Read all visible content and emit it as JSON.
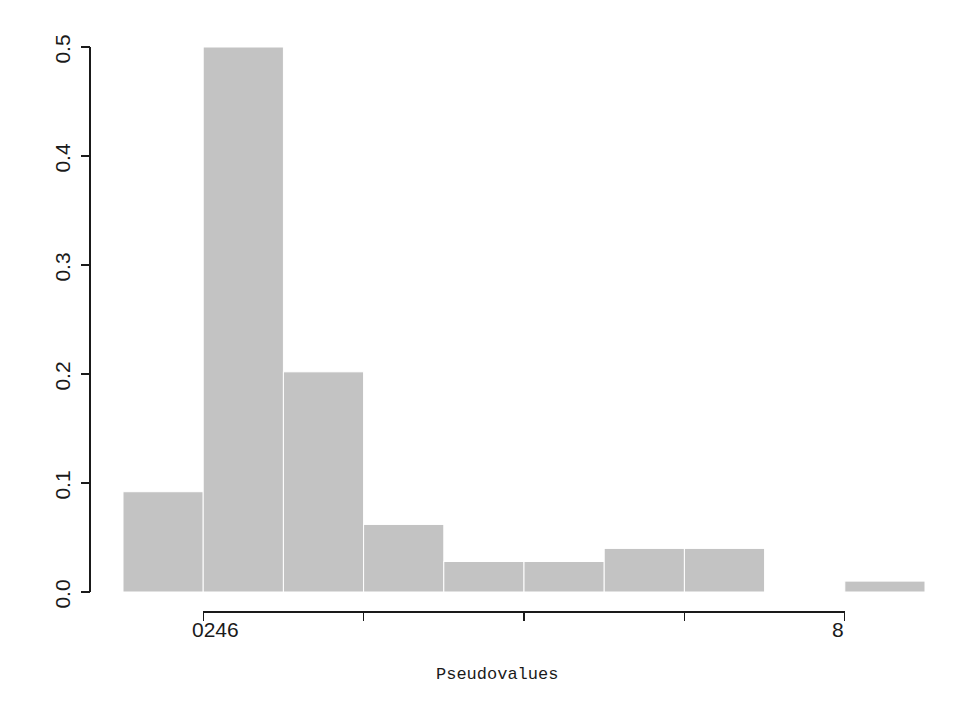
{
  "chart_data": {
    "type": "bar",
    "subtype": "histogram",
    "title": "",
    "subtitle": "",
    "xlabel": "Pseudovalues",
    "ylabel": "",
    "grid": false,
    "legend": null,
    "bar_color": "#c3c3c3",
    "axis_color": "#1a1a1a",
    "background": "#ffffff",
    "xlim": [
      -1.0,
      9.0
    ],
    "ylim": [
      0.0,
      0.5
    ],
    "y_ticks": [
      0.0,
      0.1,
      0.2,
      0.3,
      0.4,
      0.5
    ],
    "y_tick_labels": [
      "0.0",
      "0.1",
      "0.2",
      "0.3",
      "0.4",
      "0.5"
    ],
    "x_ticks": [
      0,
      2,
      4,
      6,
      8
    ],
    "x_tick_labels": [
      "0",
      "2",
      "4",
      "6",
      "8"
    ],
    "x_tick_overlap_label": "0246",
    "x_tick_last_label": "8",
    "bin_edges": [
      -1.0,
      0.0,
      1.0,
      2.0,
      3.0,
      4.0,
      5.0,
      6.0,
      7.0,
      8.0,
      9.0
    ],
    "bin_centers": [
      -0.5,
      0.5,
      1.5,
      2.5,
      3.5,
      4.5,
      5.5,
      6.5,
      7.5,
      8.5
    ],
    "values": [
      0.092,
      0.5,
      0.202,
      0.062,
      0.028,
      0.028,
      0.04,
      0.04,
      0.0,
      0.01
    ],
    "bars": [
      {
        "label": "bin--1-0",
        "x0": -1.0,
        "x1": 0.0,
        "density": 0.092
      },
      {
        "label": "bin-0-1",
        "x0": 0.0,
        "x1": 1.0,
        "density": 0.5
      },
      {
        "label": "bin-1-2",
        "x0": 1.0,
        "x1": 2.0,
        "density": 0.202
      },
      {
        "label": "bin-2-3",
        "x0": 2.0,
        "x1": 3.0,
        "density": 0.062
      },
      {
        "label": "bin-3-4",
        "x0": 3.0,
        "x1": 4.0,
        "density": 0.028
      },
      {
        "label": "bin-4-5",
        "x0": 4.0,
        "x1": 5.0,
        "density": 0.028
      },
      {
        "label": "bin-5-6",
        "x0": 5.0,
        "x1": 6.0,
        "density": 0.04
      },
      {
        "label": "bin-6-7",
        "x0": 6.0,
        "x1": 7.0,
        "density": 0.04
      },
      {
        "label": "bin-7-8",
        "x0": 7.0,
        "x1": 8.0,
        "density": 0.0
      },
      {
        "label": "bin-8-9",
        "x0": 8.0,
        "x1": 9.0,
        "density": 0.01
      }
    ]
  },
  "axis": {
    "y_labels": [
      "0.0",
      "0.1",
      "0.2",
      "0.3",
      "0.4",
      "0.5"
    ],
    "x_labels": [
      "0246",
      "8"
    ],
    "x_title": "Pseudovalues"
  }
}
